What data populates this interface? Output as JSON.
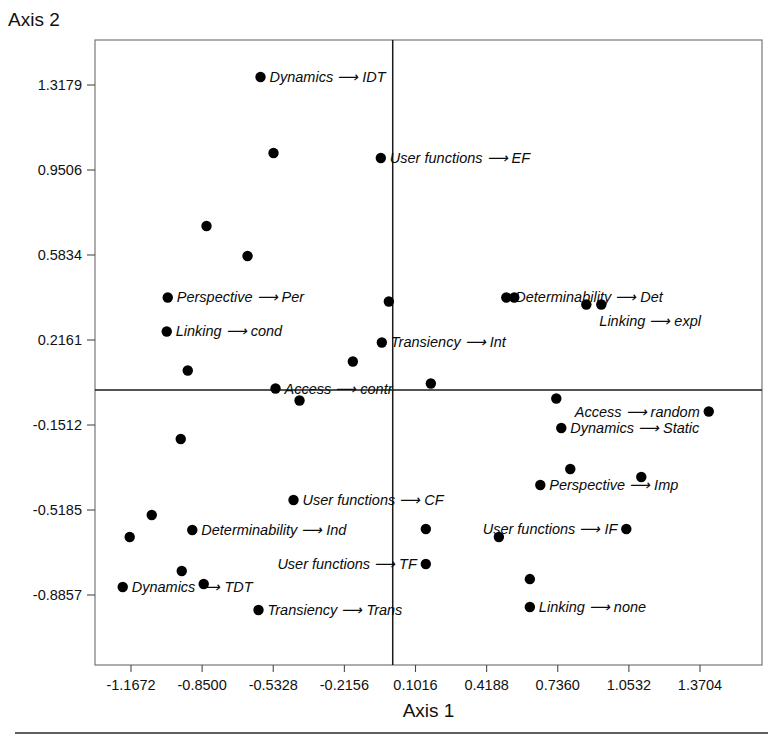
{
  "chart_data": {
    "type": "scatter",
    "title": "",
    "xlabel": "Axis 1",
    "ylabel": "Axis 2",
    "grid": false,
    "legend": "none",
    "xlim": [
      -1.3258,
      1.4497
    ],
    "ylim": [
      -1.041,
      1.4891
    ],
    "xticks": [
      "-1.1672",
      "-0.8500",
      "-0.5328",
      "-0.2156",
      "0.1016",
      "0.4188",
      "0.7360",
      "1.0532",
      "1.3704"
    ],
    "xtick_values": [
      -1.1672,
      -0.85,
      -0.5328,
      -0.2156,
      0.1016,
      0.4188,
      0.736,
      1.0532,
      1.3704
    ],
    "yticks": [
      "1.3179",
      "0.9506",
      "0.5834",
      "0.2161",
      "-0.1512",
      "-0.5185",
      "-0.8857"
    ],
    "ytick_values": [
      1.3179,
      0.9506,
      0.5834,
      0.2161,
      -0.1512,
      -0.5185,
      -0.8857
    ],
    "points": [
      {
        "x": -0.5896,
        "y": 1.3525,
        "label": "Dynamics ⟶ IDT",
        "label_pos": "right"
      },
      {
        "x": -0.5316,
        "y": 1.024,
        "label": "",
        "label_pos": "none"
      },
      {
        "x": -0.053,
        "y": 1.0024,
        "label": "User functions ⟶ EF",
        "label_pos": "right"
      },
      {
        "x": -0.8304,
        "y": 0.7086,
        "label": "",
        "label_pos": "none"
      },
      {
        "x": -0.6475,
        "y": 0.5789,
        "label": "",
        "label_pos": "none"
      },
      {
        "x": -1.0033,
        "y": 0.3998,
        "label": "Perspective ⟶ Per",
        "label_pos": "right"
      },
      {
        "x": -1.0078,
        "y": 0.2529,
        "label": "Linking ⟶ cond",
        "label_pos": "right"
      },
      {
        "x": -0.9141,
        "y": 0.0843,
        "label": "",
        "label_pos": "none"
      },
      {
        "x": -0.0173,
        "y": 0.3825,
        "label": "",
        "label_pos": "none"
      },
      {
        "x": 0.5065,
        "y": 0.3998,
        "label": "Determinability ⟶ Det",
        "label_pos": "right"
      },
      {
        "x": 0.5422,
        "y": 0.3998,
        "label": "",
        "label_pos": "none"
      },
      {
        "x": 0.8634,
        "y": 0.3696,
        "label": "",
        "label_pos": "none"
      },
      {
        "x": 0.9303,
        "y": 0.3696,
        "label": "Linking ⟶ expl",
        "label_pos": "below-right"
      },
      {
        "x": -0.0485,
        "y": 0.2054,
        "label": "Transiency ⟶ Int",
        "label_pos": "right"
      },
      {
        "x": -0.1778,
        "y": 0.1232,
        "label": "",
        "label_pos": "none"
      },
      {
        "x": -0.5227,
        "y": 0.0065,
        "label": "Access ⟶ contr",
        "label_pos": "right"
      },
      {
        "x": -0.4156,
        "y": -0.0454,
        "label": "",
        "label_pos": "none"
      },
      {
        "x": 0.17,
        "y": 0.0281,
        "label": "",
        "label_pos": "none"
      },
      {
        "x": 0.7295,
        "y": -0.0367,
        "label": "",
        "label_pos": "none"
      },
      {
        "x": 1.4095,
        "y": -0.0929,
        "label": "Access ⟶ random",
        "label_pos": "left"
      },
      {
        "x": 0.7518,
        "y": -0.1642,
        "label": "Dynamics ⟶ Static",
        "label_pos": "right"
      },
      {
        "x": -0.9454,
        "y": -0.2118,
        "label": "",
        "label_pos": "none"
      },
      {
        "x": 0.7919,
        "y": -0.3414,
        "label": "",
        "label_pos": "none"
      },
      {
        "x": 0.6582,
        "y": -0.4106,
        "label": "Perspective ⟶ Imp",
        "label_pos": "right"
      },
      {
        "x": 1.1086,
        "y": -0.376,
        "label": "",
        "label_pos": "none"
      },
      {
        "x": -0.4424,
        "y": -0.4754,
        "label": "User functions ⟶ CF",
        "label_pos": "right"
      },
      {
        "x": -1.0747,
        "y": -0.5402,
        "label": "",
        "label_pos": "none"
      },
      {
        "x": -0.8939,
        "y": -0.605,
        "label": "Determinability ⟶ Ind",
        "label_pos": "right"
      },
      {
        "x": -1.173,
        "y": -0.6353,
        "label": "",
        "label_pos": "none"
      },
      {
        "x": 0.1477,
        "y": -0.6007,
        "label": "",
        "label_pos": "none"
      },
      {
        "x": 1.0417,
        "y": -0.6007,
        "label": "User functions ⟶ IF",
        "label_pos": "left"
      },
      {
        "x": 0.4734,
        "y": -0.6353,
        "label": "",
        "label_pos": "none"
      },
      {
        "x": 0.6116,
        "y": -0.8168,
        "label": "",
        "label_pos": "none"
      },
      {
        "x": -0.9409,
        "y": -0.7821,
        "label": "",
        "label_pos": "none"
      },
      {
        "x": 0.1477,
        "y": -0.7518,
        "label": "User functions ⟶ TF",
        "label_pos": "left"
      },
      {
        "x": -1.2041,
        "y": -0.8512,
        "label": "Dynamics ⟶ TDT",
        "label_pos": "right"
      },
      {
        "x": -0.8429,
        "y": -0.8382,
        "label": "",
        "label_pos": "none"
      },
      {
        "x": 0.6116,
        "y": -0.9376,
        "label": "Linking ⟶ none",
        "label_pos": "right"
      },
      {
        "x": -0.5986,
        "y": -0.9506,
        "label": "Transiency ⟶ Trans",
        "label_pos": "right"
      }
    ]
  },
  "axes": {
    "x_title": "Axis 1",
    "y_title": "Axis 2"
  }
}
